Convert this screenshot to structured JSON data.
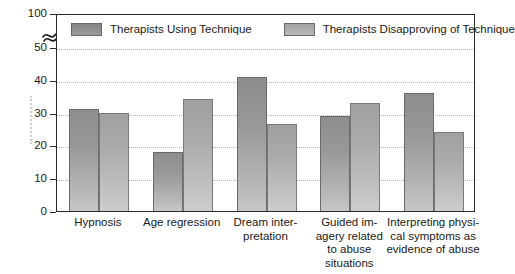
{
  "chart_data": {
    "type": "bar",
    "title": "",
    "subtitle": "",
    "xlabel": "",
    "ylabel": "",
    "categories": [
      "Hypnosis",
      "Age regression",
      "Dream inter-\npretation",
      "Guided im-\nagery related\nto abuse\nsituations",
      "Interpreting physi-\ncal symptoms as\nevidence of abuse"
    ],
    "series": [
      {
        "name": "Therapists Using Technique",
        "values": [
          31,
          18,
          41,
          29,
          36
        ],
        "color": "#929292"
      },
      {
        "name": "Therapists Disapproving of Technique",
        "values": [
          30,
          34,
          26.5,
          33,
          24
        ],
        "color": "#b0b0b0"
      }
    ],
    "ylim": [
      0,
      100
    ],
    "yticks": [
      0,
      10,
      20,
      30,
      40,
      50,
      100
    ],
    "ytick_labels": [
      "0",
      "10",
      "20",
      "30",
      "40",
      "50",
      "100"
    ],
    "axis_break": {
      "present": true,
      "between": [
        50,
        100
      ],
      "symbol": "double-slash"
    },
    "grid": true,
    "grid_axis": "y",
    "legend_position": "top-inside"
  },
  "legend": {
    "items": [
      {
        "label": "Therapists Using Technique",
        "swatch": "using"
      },
      {
        "label": "Therapists Disapproving of Technique",
        "swatch": "disapprove"
      }
    ]
  },
  "yaxis": {
    "labels": [
      "100",
      "50",
      "40",
      "30",
      "20",
      "10",
      "0"
    ]
  },
  "xaxis": {
    "labels": [
      [
        "Hypnosis"
      ],
      [
        "Age regression"
      ],
      [
        "Dream inter-",
        "pretation"
      ],
      [
        "Guided im-",
        "agery related",
        "to abuse",
        "situations"
      ],
      [
        "Interpreting physi-",
        "cal symptoms as",
        "evidence of abuse"
      ]
    ]
  }
}
